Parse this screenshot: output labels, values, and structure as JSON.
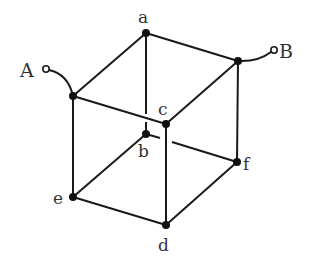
{
  "diagram": {
    "title": "",
    "type": "cube resistor network",
    "terminals": [
      {
        "id": "A",
        "label": "A"
      },
      {
        "id": "B",
        "label": "B"
      }
    ],
    "vertices": [
      {
        "id": "a",
        "label": "a"
      },
      {
        "id": "b",
        "label": "b"
      },
      {
        "id": "c",
        "label": "c"
      },
      {
        "id": "d",
        "label": "d"
      },
      {
        "id": "e",
        "label": "e"
      },
      {
        "id": "f",
        "label": "f"
      },
      {
        "id": "tl",
        "label": ""
      },
      {
        "id": "tr",
        "label": ""
      }
    ],
    "edges": [
      [
        "tl",
        "a"
      ],
      [
        "a",
        "tr"
      ],
      [
        "tl",
        "c"
      ],
      [
        "c",
        "tr"
      ],
      [
        "a",
        "b"
      ],
      [
        "tl",
        "e"
      ],
      [
        "c",
        "d"
      ],
      [
        "tr",
        "f"
      ],
      [
        "e",
        "b"
      ],
      [
        "b",
        "f"
      ],
      [
        "e",
        "d"
      ],
      [
        "d",
        "f"
      ],
      [
        "A",
        "tl"
      ],
      [
        "tr",
        "B"
      ]
    ],
    "colors": {
      "line": "#1a1a1a",
      "node": "#111111",
      "background": "#ffffff"
    }
  }
}
